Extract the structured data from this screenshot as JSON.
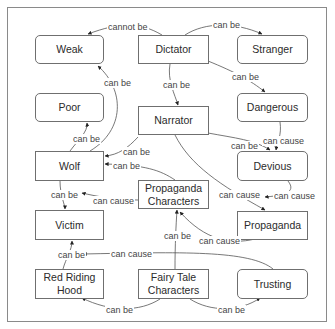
{
  "diagram": {
    "type": "concept-map",
    "nodes": [
      {
        "id": "weak",
        "label": "Weak",
        "shape": "rounded",
        "x": 35,
        "y": 35,
        "w": 69,
        "h": 29
      },
      {
        "id": "dictator",
        "label": "Dictator",
        "shape": "square",
        "x": 138,
        "y": 35,
        "w": 71,
        "h": 29
      },
      {
        "id": "stranger",
        "label": "Stranger",
        "shape": "rounded",
        "x": 237,
        "y": 35,
        "w": 71,
        "h": 29
      },
      {
        "id": "poor",
        "label": "Poor",
        "shape": "rounded",
        "x": 35,
        "y": 93,
        "w": 69,
        "h": 29
      },
      {
        "id": "narrator",
        "label": "Narrator",
        "shape": "square",
        "x": 138,
        "y": 106,
        "w": 71,
        "h": 29
      },
      {
        "id": "dangerous",
        "label": "Dangerous",
        "shape": "rounded",
        "x": 237,
        "y": 93,
        "w": 71,
        "h": 29
      },
      {
        "id": "wolf",
        "label": "Wolf",
        "shape": "square",
        "x": 35,
        "y": 151,
        "w": 69,
        "h": 30
      },
      {
        "id": "devious",
        "label": "Devious",
        "shape": "rounded",
        "x": 237,
        "y": 151,
        "w": 71,
        "h": 30
      },
      {
        "id": "propaganda_characters",
        "label": "Propaganda Characters",
        "shape": "square",
        "x": 138,
        "y": 180,
        "w": 71,
        "h": 29
      },
      {
        "id": "victim",
        "label": "Victim",
        "shape": "square",
        "x": 35,
        "y": 210,
        "w": 69,
        "h": 30
      },
      {
        "id": "propaganda",
        "label": "Propaganda",
        "shape": "square",
        "x": 237,
        "y": 211,
        "w": 71,
        "h": 29
      },
      {
        "id": "red_riding_hood",
        "label": "Red Riding Hood",
        "shape": "square",
        "x": 35,
        "y": 269,
        "w": 69,
        "h": 30
      },
      {
        "id": "fairy_tale_characters",
        "label": "Fairy Tale Characters",
        "shape": "square",
        "x": 138,
        "y": 269,
        "w": 71,
        "h": 30
      },
      {
        "id": "trusting",
        "label": "Trusting",
        "shape": "rounded",
        "x": 237,
        "y": 269,
        "w": 71,
        "h": 30
      }
    ],
    "edges": [
      {
        "from": "dictator",
        "to": "weak",
        "label": "cannot be",
        "lx": 107,
        "ly": 22,
        "path": "M162,35 C140,22 120,22 88,34"
      },
      {
        "from": "dictator",
        "to": "stranger",
        "label": "can be",
        "lx": 212,
        "ly": 20,
        "path": "M185,35 C205,22 235,22 262,34"
      },
      {
        "from": "dictator",
        "to": "dangerous",
        "label": "can be",
        "lx": 231,
        "ly": 72,
        "path": "M208,61 C235,72 250,80 265,92"
      },
      {
        "from": "dictator",
        "to": "narrator",
        "label": "can be",
        "lx": 162,
        "ly": 80,
        "path": "M170,64 C167,80 175,95 178,105"
      },
      {
        "from": "wolf",
        "to": "weak",
        "label": "can be",
        "lx": 103,
        "ly": 78,
        "path": "M90,151 C125,130 125,90 98,66"
      },
      {
        "from": "wolf",
        "to": "poor",
        "label": "can be",
        "lx": 72,
        "ly": 134,
        "path": "M70,151 C78,140 88,132 87,123"
      },
      {
        "from": "narrator",
        "to": "wolf",
        "label": "can be",
        "lx": 122,
        "ly": 147,
        "path": "M138,137 C128,148 118,155 105,156"
      },
      {
        "from": "propaganda_characters",
        "to": "wolf",
        "label": "can be",
        "lx": 112,
        "ly": 161,
        "path": "M175,180 C160,170 145,165 105,164"
      },
      {
        "from": "narrator",
        "to": "devious",
        "label": "can be",
        "lx": 230,
        "ly": 141,
        "path": "M208,133 C235,138 255,140 270,150"
      },
      {
        "from": "dangerous",
        "to": "devious",
        "label": "can cause",
        "lx": 262,
        "ly": 136,
        "path": "M280,122 C282,135 277,143 276,150"
      },
      {
        "from": "narrator",
        "to": "propaganda",
        "label": "can cause",
        "lx": 218,
        "ly": 190,
        "path": "M175,135 C190,165 220,185 265,210"
      },
      {
        "from": "devious",
        "to": "propaganda",
        "label": "can cause",
        "lx": 273,
        "ly": 191,
        "path": "M288,181 C295,190 290,195 265,197"
      },
      {
        "from": "propaganda",
        "to": "propaganda_characters",
        "label": "can cause",
        "lx": 198,
        "ly": 236,
        "path": "M255,239 C230,245 205,240 180,212"
      },
      {
        "from": "wolf",
        "to": "victim",
        "label": "can be",
        "lx": 50,
        "ly": 190,
        "path": "M60,181 C60,195 65,205 65,209"
      },
      {
        "from": "propaganda_characters",
        "to": "victim",
        "label": "can cause",
        "lx": 92,
        "ly": 196,
        "path": "M138,200 C115,200 95,196 82,193"
      },
      {
        "from": "red_riding_hood",
        "to": "victim",
        "label": "can be",
        "lx": 57,
        "ly": 250,
        "path": "M63,269 C66,258 72,250 72,241"
      },
      {
        "from": "trusting",
        "to": "victim",
        "label": "can cause",
        "lx": 110,
        "ly": 249,
        "path": "M273,269 C250,250 180,252 83,254"
      },
      {
        "from": "fairy_tale_characters",
        "to": "propaganda_characters",
        "label": "can be",
        "lx": 163,
        "ly": 231,
        "path": "M175,269 C175,245 176,225 177,210"
      },
      {
        "from": "fairy_tale_characters",
        "to": "red_riding_hood",
        "label": "can be",
        "lx": 105,
        "ly": 305,
        "path": "M160,299 C140,312 110,312 82,298"
      },
      {
        "from": "fairy_tale_characters",
        "to": "trusting",
        "label": "can be",
        "lx": 217,
        "ly": 305,
        "path": "M190,299 C210,312 240,312 260,298"
      }
    ]
  }
}
